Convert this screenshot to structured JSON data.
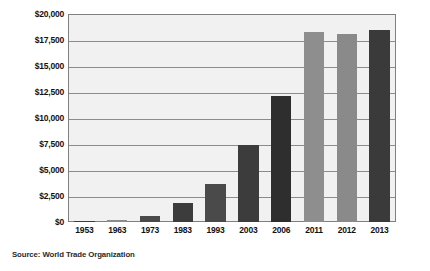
{
  "chart_data": {
    "type": "bar",
    "title": "",
    "subtitle": "",
    "xlabel": "",
    "ylabel": "",
    "categories": [
      "1953",
      "1963",
      "1973",
      "1983",
      "1993",
      "2003",
      "2006",
      "2011",
      "2012",
      "2013"
    ],
    "values": [
      84,
      157,
      579,
      1838,
      3676,
      7380,
      12113,
      18255,
      18093,
      18494
    ],
    "series": [
      {
        "name": "World merchandise exports",
        "values": [
          84,
          157,
          579,
          1838,
          3676,
          7380,
          12113,
          18255,
          18093,
          18494
        ]
      }
    ],
    "bar_colors": [
      "#3c3c3c",
      "#8c8c8c",
      "#4a4a4a",
      "#3c3c3c",
      "#4a4a4a",
      "#3c3c3c",
      "#2e2e2e",
      "#8e8e8e",
      "#8a8a8a",
      "#3a3a3a"
    ],
    "ylim": [
      0,
      20000
    ],
    "ytick_values": [
      0,
      2500,
      5000,
      7500,
      10000,
      12500,
      15000,
      17500,
      20000
    ],
    "ytick_labels": [
      "$0",
      "$2,500",
      "$5,000",
      "$7,500",
      "$10,000",
      "$12,500",
      "$15,000",
      "$17,500",
      "$20,000"
    ],
    "grid": true,
    "grid_axis": "y",
    "legend": false,
    "legend_position": "none",
    "plot_background": "#f1f1f1",
    "gridline_color": "#8c8c8c",
    "border_color": "#808080",
    "page_background": "#ffffff",
    "text_color": "#111111"
  },
  "source": {
    "label": "Source: World Trade Organization"
  }
}
